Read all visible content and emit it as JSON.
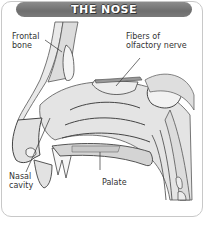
{
  "title": "THE NOSE",
  "labels": {
    "frontal_bone": [
      "Frontal",
      "bone"
    ],
    "olfactory": [
      "Fibers of",
      "olfactory nerve"
    ],
    "nasal_cavity": [
      "Nasal",
      "cavity"
    ],
    "palate": "Palate"
  },
  "colors": {
    "header_bg": "#767676",
    "header_text": "#ffffff",
    "bone_fill": "#e6e6e6",
    "tissue_fill": "#d9d9d9",
    "outline": "#444444",
    "card_border": "#c8c8c8"
  }
}
